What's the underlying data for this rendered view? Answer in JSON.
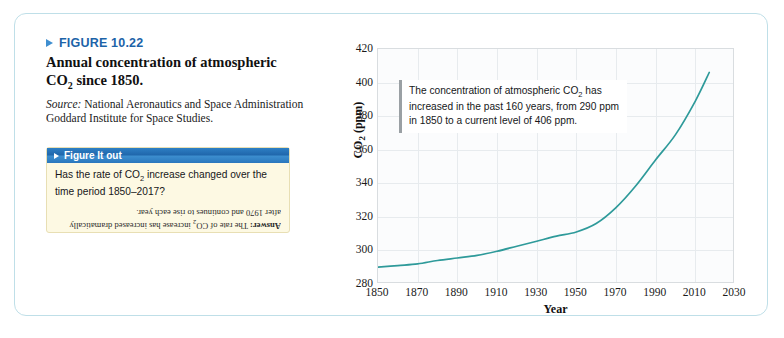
{
  "figure": {
    "number_label": "FIGURE 10.22",
    "marker_icon": "blue-triangle-icon",
    "title_line1": "Annual concentration of atmospheric",
    "title_line2_pre": "CO",
    "title_line2_sub": "2",
    "title_line2_post": " since 1850.",
    "source_label": "Source:",
    "source_text": " National Aeronautics and Space Administration Goddard Institute for Space Studies."
  },
  "figure_it_out": {
    "marker_icon": "white-triangle-icon",
    "header_title": "Figure It out",
    "question_pre": "Has the rate of CO",
    "question_sub": "2",
    "question_post": " increase changed over the time period 1850–2017?",
    "answer_label": "Answer:",
    "answer_pre": " The rate of CO",
    "answer_sub": "2",
    "answer_post": " increase has increased dramatically after 1970 and continues to rise each year."
  },
  "annotation": {
    "text_pre": "The concentration of atmospheric CO",
    "text_sub": "2",
    "text_post": " has increased in the past 160 years, from 290 ppm in 1850 to a current level of 406 ppm."
  },
  "colors": {
    "line": "#2e9a9a",
    "frame_border": "#bfdfe8",
    "figure_number": "#1c63a8",
    "header_blue": "#1f66ab",
    "callout_box": "#fdf9e3",
    "grid": "#e7ebee",
    "plot_bg": "#fbfcfd"
  },
  "chart_data": {
    "type": "line",
    "title": "Annual concentration of atmospheric CO2 since 1850",
    "xlabel": "Year",
    "ylabel": "CO2 (ppm)",
    "xlim": [
      1850,
      2030
    ],
    "ylim": [
      280,
      420
    ],
    "xticks": [
      1850,
      1870,
      1890,
      1910,
      1930,
      1950,
      1970,
      1990,
      2010,
      2030
    ],
    "yticks": [
      280,
      300,
      320,
      340,
      360,
      380,
      400,
      420
    ],
    "grid": true,
    "legend": "none",
    "series": [
      {
        "name": "Atmospheric CO2",
        "color": "#2e9a9a",
        "x": [
          1850,
          1860,
          1870,
          1880,
          1890,
          1900,
          1910,
          1920,
          1930,
          1940,
          1950,
          1960,
          1970,
          1980,
          1990,
          2000,
          2010,
          2017
        ],
        "values": [
          290,
          291,
          292,
          294,
          295.5,
          297,
          299.5,
          302.5,
          305.5,
          308.5,
          311,
          316,
          325.5,
          338.5,
          354,
          369,
          389,
          406
        ]
      }
    ],
    "annotations": [
      "The concentration of atmospheric CO2 has increased in the past 160 years, from 290 ppm in 1850 to a current level of 406 ppm."
    ]
  }
}
